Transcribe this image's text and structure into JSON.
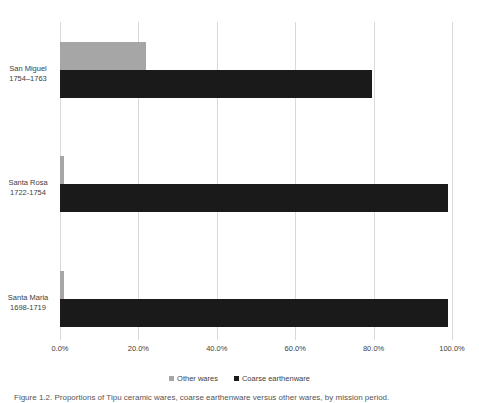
{
  "chart_data": {
    "type": "bar",
    "orientation": "horizontal",
    "stacked": false,
    "title": "",
    "xlabel": "",
    "ylabel": "",
    "categories": [
      {
        "name": "San Miguel",
        "dates": "1754–1763"
      },
      {
        "name": "Santa Rosa",
        "dates": "1722-1754"
      },
      {
        "name": "Santa Maria",
        "dates": "1698-1719"
      }
    ],
    "series": [
      {
        "name": "Other wares",
        "color": "#a6a6a6",
        "values": [
          22.0,
          1.0,
          1.0
        ]
      },
      {
        "name": "Coarse earthenware",
        "color": "#1a1a1a",
        "values": [
          79.5,
          99.0,
          99.0
        ]
      }
    ],
    "xlim": [
      0,
      100
    ],
    "xticks": [
      0,
      20,
      40,
      60,
      80,
      100
    ],
    "xtick_labels": [
      "0.0%",
      "20.0%",
      "40.0%",
      "60.0%",
      "80.0%",
      "100.0%"
    ],
    "grid": true,
    "grid_axis": "x",
    "legend_position": "bottom"
  },
  "caption": {
    "text": "Figure 1.2. Proportions of Tipu ceramic wares, coarse earthenware versus other wares, by mission period."
  }
}
